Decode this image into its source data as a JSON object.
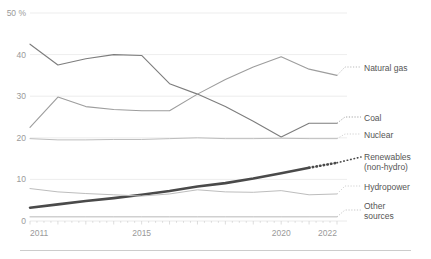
{
  "chart_data": {
    "type": "line",
    "title": "",
    "subtitle": "",
    "xlabel": "",
    "ylabel": "50 %",
    "xlim": [
      2011,
      2022
    ],
    "ylim": [
      0,
      50
    ],
    "grid": true,
    "legend_position": "right-inline-labels",
    "x": [
      2011,
      2012,
      2013,
      2014,
      2015,
      2016,
      2017,
      2018,
      2019,
      2020,
      2021,
      2022
    ],
    "yticks": [
      "50 %",
      "40",
      "30",
      "20",
      "10",
      "0"
    ],
    "ytick_values": [
      50,
      40,
      30,
      20,
      10,
      0
    ],
    "xticks": [
      "2011",
      "2015",
      "2020",
      "2022"
    ],
    "xtick_values": [
      2011,
      2015,
      2020,
      2022
    ],
    "series": [
      {
        "name": "Coal",
        "label": "Coal",
        "color": "#7d7d7d",
        "width": 1.1,
        "style": "solid",
        "values": [
          42.5,
          37.5,
          39.0,
          40.0,
          39.8,
          33.0,
          30.5,
          27.5,
          24.0,
          20.2,
          23.5,
          23.5
        ],
        "projected_from": 2021
      },
      {
        "name": "Natural gas",
        "label": "Natural gas",
        "color": "#9d9d9d",
        "width": 1.1,
        "style": "solid",
        "values": [
          22.5,
          29.8,
          27.5,
          26.8,
          26.5,
          26.5,
          30.5,
          34.0,
          37.0,
          39.5,
          36.5,
          35.0
        ],
        "projected_from": 2021
      },
      {
        "name": "Nuclear",
        "label": "Nuclear",
        "color": "#bdbdbd",
        "width": 1.0,
        "style": "solid",
        "values": [
          19.8,
          19.5,
          19.5,
          19.6,
          19.6,
          19.8,
          20.0,
          19.8,
          19.8,
          19.9,
          19.8,
          19.8
        ],
        "projected_from": 2021
      },
      {
        "name": "Renewables (non-hydro)",
        "label": "Renewables",
        "label2": "(non-hydro)",
        "color": "#4a4a4a",
        "width": 2.6,
        "style": "solid-then-dotted",
        "values": [
          3.2,
          4.0,
          4.8,
          5.5,
          6.3,
          7.2,
          8.3,
          9.1,
          10.2,
          11.5,
          12.8,
          14.0
        ],
        "projected_from": 2021
      },
      {
        "name": "Hydropower",
        "label": "Hydropower",
        "color": "#bdbdbd",
        "width": 1.0,
        "style": "solid",
        "values": [
          7.8,
          7.0,
          6.6,
          6.3,
          6.0,
          6.5,
          7.5,
          7.0,
          6.9,
          7.3,
          6.3,
          6.5
        ],
        "projected_from": 2021
      },
      {
        "name": "Other sources",
        "label": "Other",
        "label2": "sources",
        "color": "#b0b0b0",
        "width": 0.9,
        "style": "solid",
        "values": [
          1.0,
          1.0,
          1.0,
          1.0,
          1.0,
          1.0,
          1.0,
          1.0,
          1.0,
          1.0,
          1.0,
          1.0
        ],
        "projected_from": 2021
      }
    ]
  },
  "axis": {
    "y_labels": [
      {
        "text": "50 %",
        "value": 50
      },
      {
        "text": "40",
        "value": 40
      },
      {
        "text": "30",
        "value": 30
      },
      {
        "text": "20",
        "value": 20
      },
      {
        "text": "10",
        "value": 10
      },
      {
        "text": "0",
        "value": 0
      }
    ],
    "x_labels": [
      {
        "text": "2011",
        "value": 2011
      },
      {
        "text": "2015",
        "value": 2015
      },
      {
        "text": "2020",
        "value": 2020
      },
      {
        "text": "2022",
        "value": 2022
      }
    ]
  },
  "legend_labels": {
    "natural_gas": "Natural gas",
    "coal": "Coal",
    "nuclear": "Nuclear",
    "renewables_line1": "Renewables",
    "renewables_line2": "(non-hydro)",
    "hydropower": "Hydropower",
    "other_line1": "Other",
    "other_line2": "sources"
  },
  "colors": {
    "background": "#ffffff",
    "grid": "#e8e8e8",
    "tick_text": "#9a9a9a",
    "label_text": "#555555",
    "footer_rule": "#cccccc",
    "coal": "#7d7d7d",
    "natural_gas": "#9d9d9d",
    "nuclear": "#bdbdbd",
    "renewables": "#4a4a4a",
    "hydropower": "#bdbdbd",
    "other": "#b0b0b0"
  }
}
